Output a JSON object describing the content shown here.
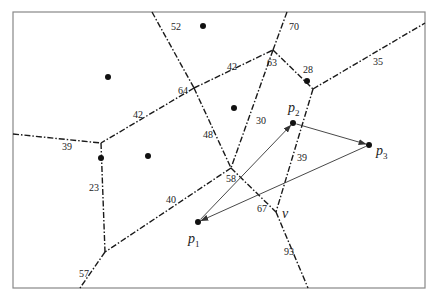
{
  "diagram": {
    "type": "voronoi-diagram",
    "frame": {
      "x": 13,
      "y": 12,
      "width": 412,
      "height": 276,
      "stroke": "#888888"
    },
    "colors": {
      "edge": "#1a1a1a",
      "site": "#111111",
      "arrow": "#333333"
    },
    "vertices": {
      "A": [
        194,
        88
      ],
      "B": [
        273,
        50
      ],
      "C": [
        313,
        89
      ],
      "D": [
        101,
        143
      ],
      "E": [
        231,
        168
      ],
      "F": [
        105,
        252
      ],
      "V": [
        276,
        212
      ]
    },
    "edges": [
      {
        "from": [
          152,
          12
        ],
        "to": [
          194,
          88
        ],
        "label": "52",
        "label_pos": [
          171,
          30
        ]
      },
      {
        "from": [
          194,
          88
        ],
        "to": [
          273,
          50
        ],
        "label": "42",
        "label_pos": [
          227,
          70
        ]
      },
      {
        "from": [
          287,
          12
        ],
        "to": [
          273,
          50
        ],
        "label": "70",
        "label_pos": [
          289,
          30
        ]
      },
      {
        "from": [
          273,
          50
        ],
        "to": [
          313,
          89
        ],
        "label": "28",
        "label_pos": [
          303,
          73
        ]
      },
      {
        "from": [
          313,
          89
        ],
        "to": [
          425,
          23
        ],
        "label": "35",
        "label_pos": [
          373,
          65
        ]
      },
      {
        "from": [
          194,
          88
        ],
        "to": [
          101,
          143
        ],
        "label": "42",
        "label_pos": [
          133,
          118
        ]
      },
      {
        "from": [
          13,
          134
        ],
        "to": [
          101,
          143
        ],
        "label": "39",
        "label_pos": [
          62,
          150
        ]
      },
      {
        "from": [
          194,
          88
        ],
        "to": [
          231,
          168
        ],
        "label": "48",
        "label_pos": [
          203,
          138
        ]
      },
      {
        "from": [
          273,
          50
        ],
        "to": [
          231,
          168
        ],
        "label": "30",
        "label_pos": [
          256,
          124
        ]
      },
      {
        "from": [
          313,
          89
        ],
        "to": [
          276,
          212
        ],
        "label": "39",
        "label_pos": [
          297,
          161
        ]
      },
      {
        "from": [
          101,
          143
        ],
        "to": [
          105,
          252
        ],
        "label": "23",
        "label_pos": [
          89,
          191
        ]
      },
      {
        "from": [
          231,
          168
        ],
        "to": [
          105,
          252
        ],
        "label": "40",
        "label_pos": [
          166,
          203
        ]
      },
      {
        "from": [
          105,
          252
        ],
        "to": [
          80,
          288
        ],
        "label": "57",
        "label_pos": [
          79,
          277
        ]
      },
      {
        "from": [
          231,
          168
        ],
        "to": [
          276,
          212
        ],
        "label": "67",
        "label_pos": [
          257,
          212
        ]
      },
      {
        "from": [
          276,
          212
        ],
        "to": [
          308,
          288
        ],
        "label": "93",
        "label_pos": [
          284,
          255
        ]
      }
    ],
    "vertex_labels": [
      {
        "text": "64",
        "pos": [
          178,
          94
        ]
      },
      {
        "text": "63",
        "pos": [
          267,
          66
        ]
      },
      {
        "text": "58",
        "pos": [
          226,
          182
        ]
      }
    ],
    "sites": [
      {
        "pos": [
          203,
          26
        ]
      },
      {
        "pos": [
          108,
          77
        ]
      },
      {
        "pos": [
          234,
          108
        ]
      },
      {
        "pos": [
          148,
          156
        ]
      },
      {
        "pos": [
          101,
          158
        ]
      },
      {
        "pos": [
          307,
          81
        ]
      },
      {
        "pos": [
          293,
          123
        ],
        "name": "p",
        "sub": "2",
        "label_pos": [
          288,
          112
        ]
      },
      {
        "pos": [
          369,
          145
        ],
        "name": "p",
        "sub": "3",
        "label_pos": [
          376,
          155
        ]
      },
      {
        "pos": [
          198,
          222
        ],
        "name": "p",
        "sub": "1",
        "label_pos": [
          188,
          243
        ]
      }
    ],
    "arrows": [
      {
        "from": [
          198,
          222
        ],
        "to": [
          293,
          123
        ]
      },
      {
        "from": [
          293,
          123
        ],
        "to": [
          369,
          145
        ]
      },
      {
        "from": [
          369,
          145
        ],
        "to": [
          198,
          222
        ]
      }
    ],
    "special_vertex_label": {
      "text": "v",
      "pos": [
        282,
        218
      ]
    }
  }
}
